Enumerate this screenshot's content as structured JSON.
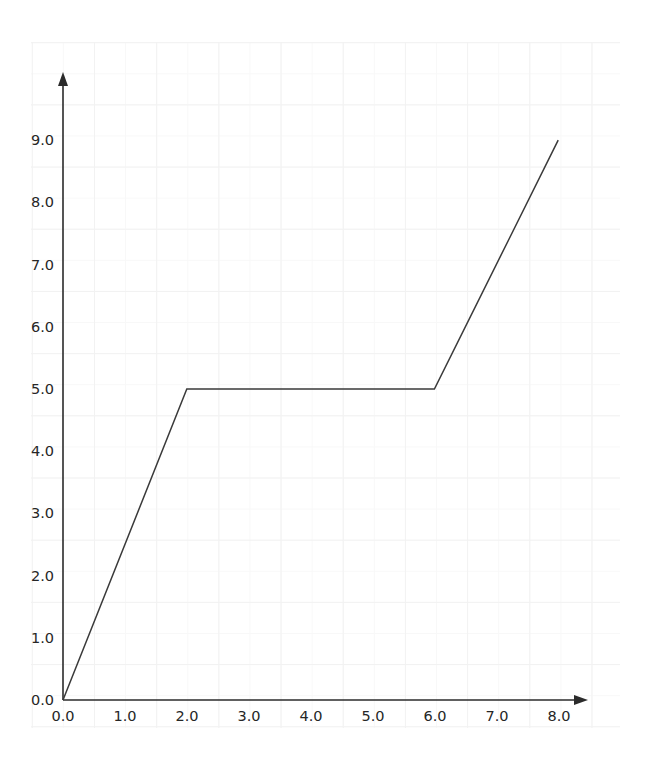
{
  "chart_data": {
    "type": "line",
    "title": "",
    "subtitle": "",
    "xlabel": "",
    "ylabel": "",
    "x": [
      0.0,
      2.0,
      6.0,
      8.0
    ],
    "y": [
      0.0,
      5.0,
      5.0,
      9.0
    ],
    "series": [
      {
        "name": "",
        "points": [
          {
            "x": 0.0,
            "y": 0.0
          },
          {
            "x": 2.0,
            "y": 5.0
          },
          {
            "x": 6.0,
            "y": 5.0
          },
          {
            "x": 8.0,
            "y": 9.0
          }
        ]
      }
    ],
    "xlim": [
      0.0,
      8.8
    ],
    "ylim": [
      0.0,
      10.1
    ],
    "xticks": [
      "0.0",
      "1.0",
      "2.0",
      "3.0",
      "4.0",
      "5.0",
      "6.0",
      "7.0",
      "8.0"
    ],
    "xtick_values": [
      0.0,
      1.0,
      2.0,
      3.0,
      4.0,
      5.0,
      6.0,
      7.0,
      8.0
    ],
    "yticks": [
      "0.0",
      "1.0",
      "2.0",
      "3.0",
      "4.0",
      "5.0",
      "6.0",
      "7.0",
      "8.0",
      "9.0"
    ],
    "ytick_values": [
      0.0,
      1.0,
      2.0,
      3.0,
      4.0,
      5.0,
      6.0,
      7.0,
      8.0,
      9.0
    ],
    "grid": true,
    "grid_minor": true,
    "legend": false,
    "legend_position": "none",
    "annotations": [],
    "line_color": "#3a3a3a",
    "axis_color": "#2b2b2b",
    "grid_color": "#f2f2f2",
    "grid_minor_color": "#f8f8f8",
    "background_color": "#ffffff",
    "axis_arrows": true,
    "axis_origin_label_x": "0.0",
    "axis_origin_label_y": "0.0"
  }
}
